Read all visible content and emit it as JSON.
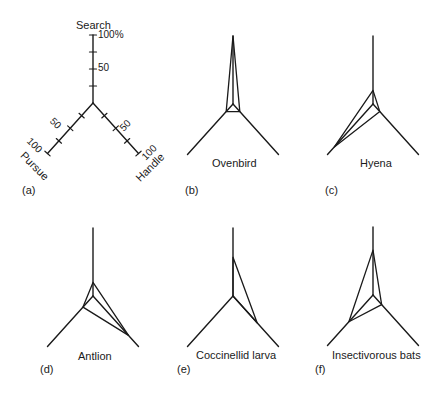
{
  "figure": {
    "axes": {
      "search": "Search",
      "pursue": "Pursue",
      "handle": "Handle",
      "search_ticks": [
        "100%",
        "50"
      ],
      "pursue_ticks": [
        "50",
        "100"
      ],
      "handle_ticks": [
        "50",
        "100"
      ]
    },
    "panels": [
      {
        "id": "a",
        "letter": "(a)",
        "name": ""
      },
      {
        "id": "b",
        "letter": "(b)",
        "name": "Ovenbird"
      },
      {
        "id": "c",
        "letter": "(c)",
        "name": "Hyena"
      },
      {
        "id": "d",
        "letter": "(d)",
        "name": "Antlion"
      },
      {
        "id": "e",
        "letter": "(e)",
        "name": "Coccinellid larva"
      },
      {
        "id": "f",
        "letter": "(f)",
        "name": "Insectivorous bats"
      }
    ]
  },
  "chart_data": {
    "type": "radar",
    "title": "",
    "axes": [
      "Search",
      "Pursue",
      "Handle"
    ],
    "unit": "%",
    "range": [
      0,
      100
    ],
    "ticks": [
      0,
      25,
      50,
      75,
      100
    ],
    "series": [
      {
        "name": "Ovenbird",
        "panel": "(b)",
        "values": {
          "Search": 100,
          "Pursue": 15,
          "Handle": 15
        }
      },
      {
        "name": "Hyena",
        "panel": "(c)",
        "values": {
          "Search": 20,
          "Pursue": 85,
          "Handle": 15
        }
      },
      {
        "name": "Antlion",
        "panel": "(d)",
        "values": {
          "Search": 20,
          "Pursue": 22,
          "Handle": 78
        }
      },
      {
        "name": "Coccinellid larva",
        "panel": "(e)",
        "values": {
          "Search": 57,
          "Pursue": 0,
          "Handle": 53
        }
      },
      {
        "name": "Insectivorous bats",
        "panel": "(f)",
        "values": {
          "Search": 66,
          "Pursue": 53,
          "Handle": 19
        }
      }
    ]
  }
}
